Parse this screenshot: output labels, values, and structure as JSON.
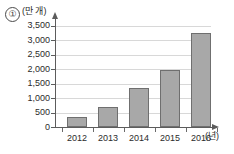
{
  "figure": {
    "item_number": "①",
    "y_unit_label": "(만 개)",
    "x_unit_label": "(년)"
  },
  "chart_data": {
    "type": "bar",
    "title": "",
    "subtitle": "",
    "xlabel": "(년)",
    "ylabel": "(만 개)",
    "categories": [
      "2012",
      "2013",
      "2014",
      "2015",
      "2016"
    ],
    "values": [
      330,
      690,
      1350,
      1960,
      3250
    ],
    "series": [
      {
        "name": "개수",
        "values": [
          330,
          690,
          1350,
          1960,
          3250
        ]
      }
    ],
    "ylim": [
      0,
      3500
    ],
    "ytick_values": [
      0,
      500,
      1000,
      1500,
      2000,
      2500,
      3000,
      3500
    ],
    "ytick_labels": [
      "0",
      "500",
      "1,000",
      "1,500",
      "2,000",
      "2,500",
      "3,000",
      "3,500"
    ],
    "grid": true,
    "grid_axis": "y",
    "legend": false,
    "legend_position": "none",
    "bar_color": "#a8a8a8",
    "bar_edge_color": "#6f6f6f",
    "grid_color": "#d8d8d8",
    "axis_color": "#5c5c5c",
    "annotations": []
  }
}
